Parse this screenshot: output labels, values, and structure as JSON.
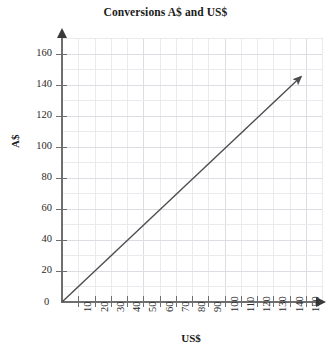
{
  "chart_data": {
    "type": "line",
    "title": "Conversions A$ and US$",
    "xlabel": "US$",
    "ylabel": "A$",
    "xlim": [
      0,
      150
    ],
    "ylim": [
      0,
      160
    ],
    "grid": true,
    "legend": "none",
    "origin_label": "0",
    "x_ticks": [
      10,
      20,
      30,
      40,
      50,
      60,
      70,
      80,
      90,
      100,
      110,
      120,
      130,
      140,
      150
    ],
    "x_tick_labels": [
      "10",
      "20",
      "30",
      "40",
      "50",
      "60",
      "70",
      "80",
      "90",
      "100",
      "110",
      "120",
      "130",
      "140",
      "150"
    ],
    "y_ticks": [
      0,
      20,
      40,
      60,
      80,
      100,
      120,
      140,
      160
    ],
    "y_tick_labels": [
      "0",
      "20",
      "40",
      "60",
      "80",
      "100",
      "120",
      "140",
      "160"
    ],
    "series": [
      {
        "name": "conversion-line",
        "x": [
          0,
          147
        ],
        "values": [
          0,
          145
        ],
        "annotation": "arrow-terminated ray from origin",
        "color": "#4d4d4d"
      }
    ],
    "colors": {
      "line": "#4d4d4d",
      "axis": "#6e6e6e",
      "grid_minor": "#e9e9ee",
      "grid_major": "#dcdce3",
      "text": "#1a1a1a",
      "background": "#ffffff"
    }
  }
}
